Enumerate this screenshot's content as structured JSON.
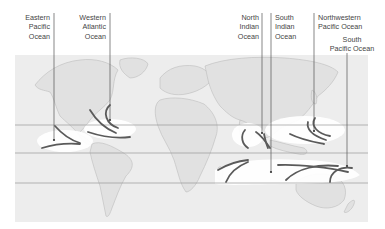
{
  "map": {
    "title": "",
    "type": "world map - tropical cyclone basins",
    "colors": {
      "background": "#ffffff",
      "ocean": "#ededed",
      "land": "#e2e2e2",
      "coast": "#b8b8b8",
      "highlight": "#ffffff",
      "track": "#5a5a5a",
      "leader": "#555555",
      "latitude_line": "#9a9a9a"
    },
    "labels": [
      {
        "id": "eastern-pacific",
        "lines": [
          "Eastern",
          "Pacific",
          "Ocean"
        ]
      },
      {
        "id": "western-atlantic",
        "lines": [
          "Western",
          "Atlantic",
          "Ocean"
        ]
      },
      {
        "id": "north-indian",
        "lines": [
          "North",
          "Indian",
          "Ocean"
        ]
      },
      {
        "id": "south-indian",
        "lines": [
          "South",
          "Indian",
          "Ocean"
        ]
      },
      {
        "id": "northwestern-pacific",
        "lines": [
          "Northwestern",
          "Pacific Ocean"
        ]
      },
      {
        "id": "south-pacific",
        "lines": [
          "South",
          "Pacific Ocean"
        ]
      }
    ]
  }
}
